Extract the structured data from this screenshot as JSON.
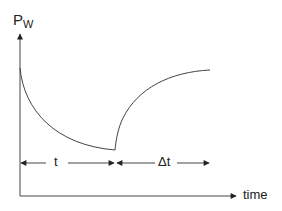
{
  "diagram": {
    "y_axis_label_main": "P",
    "y_axis_label_sub": "W",
    "x_axis_label": "time",
    "interval_1_label": "t",
    "interval_2_label": "Δt",
    "stroke_color": "#444444"
  }
}
